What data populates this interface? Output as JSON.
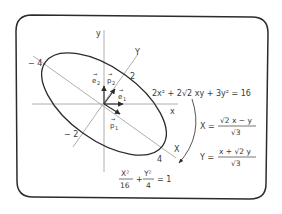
{
  "diagram": {
    "axes": {
      "x_label": "x",
      "y_label": "y",
      "X_label": "X",
      "Y_label": "Y"
    },
    "ticks": {
      "X_neg": "− 4",
      "X_pos": "4",
      "Y_pos": "2",
      "Y_neg": "− 2"
    },
    "vectors": {
      "e1": "e",
      "e1_sub": "1",
      "e2": "e",
      "e2_sub": "2",
      "p1": "p",
      "p1_sub": "1",
      "p2": "p",
      "p2_sub": "2"
    },
    "equation": {
      "original": "2x² + 2√2 xy + 3y² = 16",
      "X_lhs": "X =",
      "X_num": "√2 x − y",
      "X_den": "√3",
      "Y_lhs": "Y =",
      "Y_num": "x + √2 y",
      "Y_den": "√3",
      "reduced_X_num": "X²",
      "reduced_X_den": "16",
      "reduced_plus": "+",
      "reduced_Y_num": "Y²",
      "reduced_Y_den": "4",
      "reduced_rhs": "= 1"
    },
    "colors": {
      "stroke": "#2b2b2b",
      "axis": "#8a8a8a",
      "text": "#3a3a3a"
    }
  }
}
